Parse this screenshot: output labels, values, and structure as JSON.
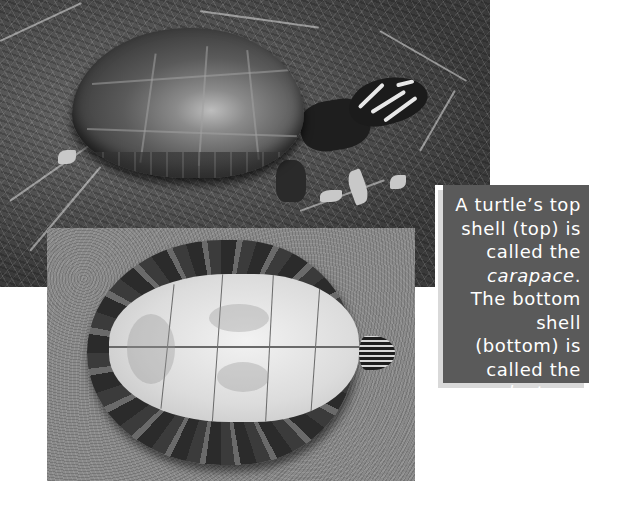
{
  "figure": {
    "top_photo": {
      "subject": "turtle top view showing carapace in grass",
      "colors": {
        "grass": "#4a4a4a",
        "shell_highlight": "#bdbdbd",
        "head": "#1b1b1b"
      }
    },
    "bottom_photo": {
      "subject": "turtle underside showing plastron on sand",
      "colors": {
        "sand": "#8a8a8a",
        "plastron": "#e4e4e4",
        "rim": "#2b2b2b"
      }
    },
    "caption": {
      "background": "#5a5a5a",
      "shadow": "#d9d9d9",
      "text_color": "#ffffff",
      "part1": "A turtle’s top shell (top) is called the ",
      "term1": "carapace",
      "part2": ". The bottom shell (bottom) is called the ",
      "term2": "plastron",
      "part3": "."
    }
  }
}
